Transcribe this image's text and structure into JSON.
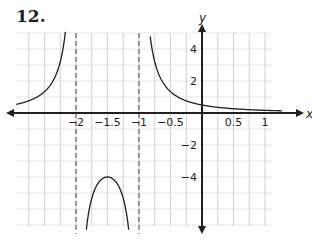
{
  "problem": {
    "number": "12."
  },
  "chart_data": {
    "type": "line",
    "title": "",
    "xlabel": "x",
    "ylabel": "y",
    "xlim": [
      -2.95,
      1.25
    ],
    "ylim": [
      -5.6,
      5.1
    ],
    "grid": true,
    "x_grid_step": 0.25,
    "y_grid_step": 1,
    "x_ticks": [
      {
        "value": -2,
        "label": "−2"
      },
      {
        "value": -1.5,
        "label": "−1.5"
      },
      {
        "value": -1,
        "label": "−1"
      },
      {
        "value": -0.5,
        "label": "−0.5"
      },
      {
        "value": 0.5,
        "label": "0.5"
      },
      {
        "value": 1,
        "label": "1"
      }
    ],
    "y_ticks": [
      {
        "value": 4,
        "label": "4"
      },
      {
        "value": 2,
        "label": "2"
      },
      {
        "value": -2,
        "label": "−2"
      },
      {
        "value": -4,
        "label": "−4"
      }
    ],
    "asymptotes": [
      {
        "type": "vertical",
        "x": -2,
        "style": "dashed"
      },
      {
        "type": "vertical",
        "x": -1,
        "style": "dashed"
      },
      {
        "type": "horizontal",
        "y": 0
      }
    ],
    "function": "y = 1/((x+1)(x+2))",
    "series": [
      {
        "name": "left branch",
        "x": [
          -2.95,
          -2.75,
          -2.5,
          -2.35,
          -2.25,
          -2.2
        ],
        "y": [
          0.36,
          0.76,
          2.67,
          8.16,
          5.33,
          4.17
        ]
      },
      {
        "name": "middle branch",
        "x": [
          -1.9,
          -1.75,
          -1.6,
          -1.5,
          -1.4,
          -1.25,
          -1.1
        ],
        "y": [
          -11.11,
          -5.33,
          -4.17,
          -4.0,
          -4.17,
          -5.33,
          -11.11
        ]
      },
      {
        "name": "right branch",
        "x": [
          -0.8,
          -0.6,
          -0.5,
          -0.25,
          0,
          0.25,
          0.5,
          1.0,
          1.2
        ],
        "y": [
          4.17,
          2.08,
          1.33,
          0.76,
          0.5,
          0.36,
          0.27,
          0.17,
          0.14
        ]
      }
    ],
    "key_points": [
      {
        "x": -1.5,
        "y": -4,
        "label": "local maximum"
      },
      {
        "x": 0,
        "y": 0.5,
        "label": "y-intercept"
      }
    ]
  }
}
